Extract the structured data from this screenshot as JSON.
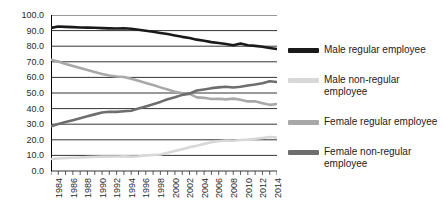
{
  "chart_data": {
    "type": "line",
    "title": "",
    "xlabel": "",
    "ylabel": "",
    "ylim": [
      0,
      100
    ],
    "ytick_step": 10,
    "ytick_labels": [
      "100.0",
      "90.0",
      "80.0",
      "70.0",
      "60.0",
      "50.0",
      "40.0",
      "30.0",
      "20.0",
      "10.0",
      "0.0"
    ],
    "ytick_values": [
      100,
      90,
      80,
      70,
      60,
      50,
      40,
      30,
      20,
      10,
      0
    ],
    "grid": "horizontal",
    "legend_position": "right",
    "x": [
      1984,
      1985,
      1986,
      1987,
      1988,
      1989,
      1990,
      1991,
      1992,
      1993,
      1994,
      1995,
      1996,
      1997,
      1998,
      1999,
      2000,
      2001,
      2002,
      2003,
      2004,
      2005,
      2006,
      2007,
      2008,
      2009,
      2010,
      2011,
      2012,
      2013,
      2014,
      2015
    ],
    "xtick_labels": [
      "1984",
      "1986",
      "1988",
      "1990",
      "1992",
      "1994",
      "1996",
      "1998",
      "2000",
      "2002",
      "2004",
      "2006",
      "2008",
      "2010",
      "2012",
      "2014"
    ],
    "xtick_values": [
      1984,
      1986,
      1988,
      1990,
      1992,
      1994,
      1996,
      1998,
      2000,
      2002,
      2004,
      2006,
      2008,
      2010,
      2012,
      2014
    ],
    "series": [
      {
        "name": "Male regular employee",
        "color": "#1a1a1a",
        "values": [
          91.7,
          92.6,
          92.4,
          92.2,
          92.0,
          91.9,
          91.8,
          91.6,
          91.4,
          91.3,
          91.5,
          91.2,
          90.5,
          89.9,
          89.3,
          88.5,
          87.8,
          86.9,
          86.0,
          85.3,
          84.2,
          83.5,
          82.6,
          82.0,
          81.4,
          80.6,
          81.7,
          80.6,
          80.2,
          79.7,
          78.9,
          78.2
        ]
      },
      {
        "name": "Male non-regular employee",
        "color": "#d8d8d8",
        "values": [
          7.7,
          8.0,
          8.3,
          8.5,
          8.7,
          8.9,
          9.1,
          9.2,
          9.2,
          9.3,
          9.4,
          9.2,
          9.5,
          10.0,
          10.3,
          10.6,
          11.7,
          12.8,
          13.9,
          15.3,
          16.2,
          17.3,
          18.4,
          19.1,
          19.6,
          19.4,
          19.9,
          20.1,
          20.7,
          21.2,
          21.8,
          21.5
        ]
      },
      {
        "name": "Female regular employee",
        "color": "#a8a8a8",
        "values": [
          71.3,
          70.2,
          68.6,
          67.3,
          66.0,
          64.7,
          63.4,
          62.2,
          61.2,
          60.6,
          60.3,
          59.2,
          57.8,
          56.4,
          55.1,
          53.6,
          52.2,
          50.8,
          49.8,
          49.4,
          47.2,
          46.9,
          46.2,
          46.3,
          45.9,
          46.4,
          45.7,
          44.6,
          44.7,
          43.5,
          42.4,
          43.0
        ]
      },
      {
        "name": "Female non-regular employee",
        "color": "#6e6e6e",
        "values": [
          28.7,
          30.2,
          31.4,
          32.6,
          33.8,
          35.1,
          36.3,
          37.5,
          38.0,
          37.9,
          38.3,
          38.6,
          40.0,
          41.4,
          42.8,
          44.3,
          46.0,
          47.3,
          48.8,
          49.6,
          51.6,
          52.3,
          53.1,
          53.6,
          54.0,
          53.5,
          54.0,
          54.8,
          55.4,
          56.3,
          57.5,
          57.0
        ]
      }
    ]
  },
  "legend": {
    "entries": [
      {
        "label": "Male regular employee",
        "color": "#1a1a1a"
      },
      {
        "label": "Male non-regular employee",
        "color": "#d8d8d8"
      },
      {
        "label": "Female regular employee",
        "color": "#a8a8a8"
      },
      {
        "label": "Female non-regular employee",
        "color": "#6e6e6e"
      }
    ]
  }
}
